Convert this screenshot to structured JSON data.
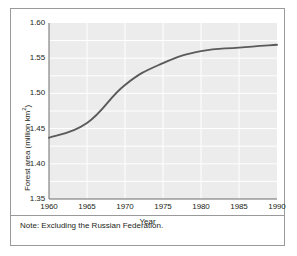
{
  "figure": {
    "note": "Note: Excluding the Russian Federation."
  },
  "chart_data": {
    "type": "line",
    "title": "",
    "xlabel": "Year",
    "ylabel": "Forest area (million km2)",
    "ylabel_main": "Forest area (million km",
    "ylabel_sup": "2",
    "ylabel_tail": ")",
    "x": [
      1960,
      1965,
      1970,
      1975,
      1980,
      1985,
      1990
    ],
    "values": [
      1.437,
      1.458,
      1.512,
      1.543,
      1.56,
      1.565,
      1.569
    ],
    "xlim": [
      1960,
      1990
    ],
    "ylim": [
      1.35,
      1.6
    ],
    "xticks": [
      1960,
      1965,
      1970,
      1975,
      1980,
      1985,
      1990
    ],
    "xticklabels": [
      "1960",
      "1965",
      "1970",
      "1975",
      "1980",
      "1985",
      "1990"
    ],
    "yticks": [
      1.35,
      1.4,
      1.45,
      1.5,
      1.55,
      1.6
    ],
    "yticklabels": [
      "1.35",
      "1.40",
      "1.45",
      "1.50",
      "1.55",
      "1.60"
    ],
    "y_minor_step": 0.025,
    "grid": true,
    "legend": null,
    "series": [
      {
        "name": "Forest area",
        "values": [
          1.437,
          1.458,
          1.512,
          1.543,
          1.56,
          1.565,
          1.569
        ]
      }
    ],
    "colors": {
      "line": "#5a5a5a",
      "plot_background": "#ececec",
      "gridline": "#ffffff",
      "axis": "#6d6d6d",
      "text": "#231f20",
      "frame": "#9a9a9a"
    }
  }
}
